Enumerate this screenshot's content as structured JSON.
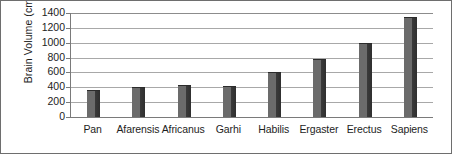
{
  "chart_data": {
    "type": "bar",
    "title": "",
    "xlabel": "",
    "ylabel": "Brain Volume (cm3)",
    "ylabel_text": "Brain Volume (cm",
    "ylabel_sup": "3",
    "ylabel_close": ")",
    "categories": [
      "Pan",
      "Afarensis",
      "Africanus",
      "Garhi",
      "Habilis",
      "Ergaster",
      "Erectus",
      "Sapiens"
    ],
    "values": [
      360,
      400,
      425,
      420,
      600,
      780,
      990,
      1350
    ],
    "ylim": [
      0,
      1400
    ],
    "yticks": [
      0,
      200,
      400,
      600,
      800,
      1000,
      1200,
      1400
    ],
    "ytick_labels": [
      "0",
      "200",
      "400",
      "600",
      "800",
      "1000",
      "1200",
      "1400"
    ],
    "grid": "horizontal",
    "legend": "none",
    "bar_color": "#5f5f5f",
    "grid_color": "#a8a8a8",
    "axis_color": "#7a7a7a",
    "text_color": "#1d1d1d",
    "background": "#ffffff"
  }
}
